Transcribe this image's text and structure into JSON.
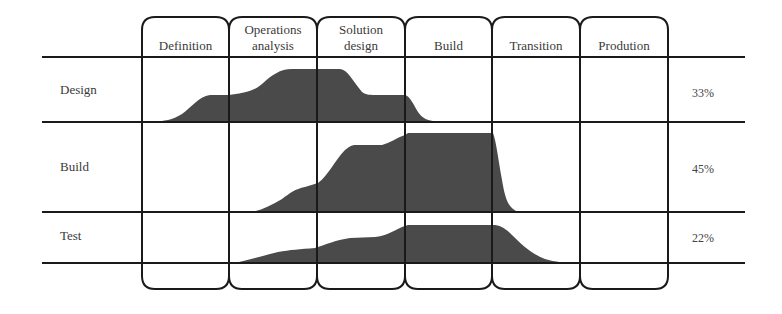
{
  "diagram": {
    "title": "",
    "phases": [
      {
        "label_line1": "",
        "label_line2": "Definition"
      },
      {
        "label_line1": "Operations",
        "label_line2": "analysis"
      },
      {
        "label_line1": "Solution",
        "label_line2": "design"
      },
      {
        "label_line1": "",
        "label_line2": "Build"
      },
      {
        "label_line1": "",
        "label_line2": "Transition"
      },
      {
        "label_line1": "",
        "label_line2": "Prodution"
      }
    ],
    "activities": [
      {
        "label": "Design",
        "share": "33%"
      },
      {
        "label": "Build",
        "share": "45%"
      },
      {
        "label": "Test",
        "share": "22%"
      }
    ],
    "colors": {
      "line": "#1a1a1a",
      "fill": "#4a4a4a",
      "text": "#3a3a3a"
    }
  }
}
